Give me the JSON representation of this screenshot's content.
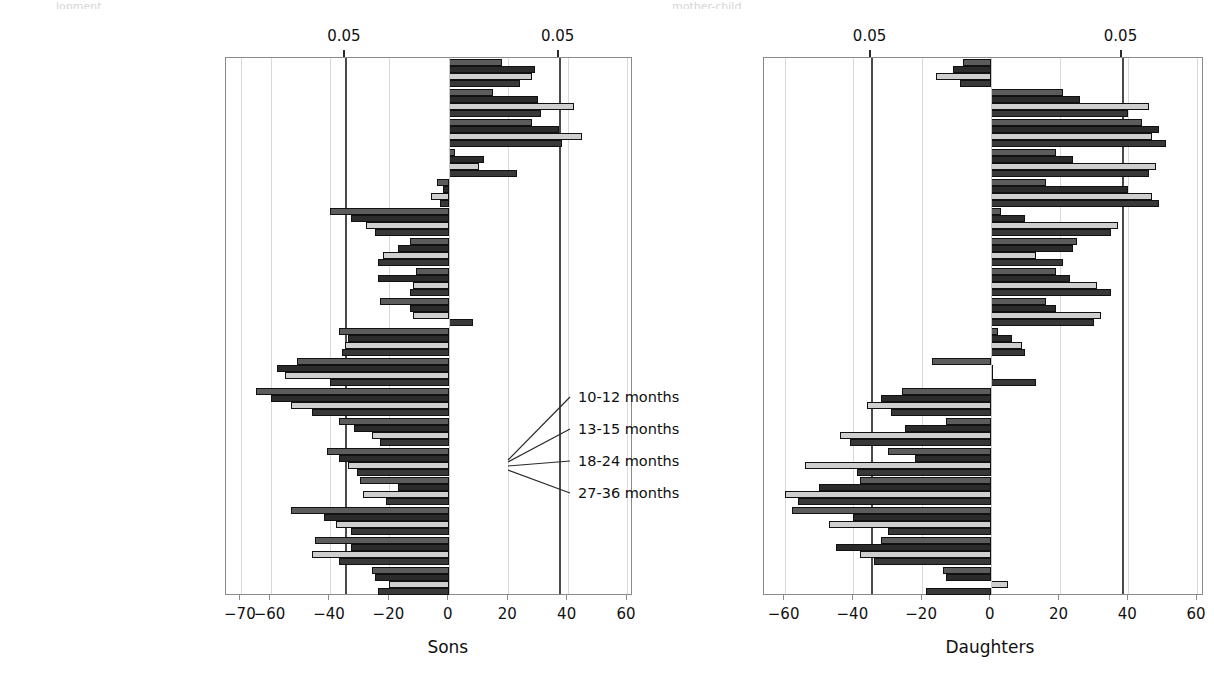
{
  "figure": {
    "top_fragments": [
      "lopment",
      "mother-child"
    ],
    "legend": {
      "items": [
        "10-12 months",
        "13-15 months",
        "18-24 months",
        "27-36 months"
      ],
      "series_keys": [
        "10-12",
        "13-15",
        "18-24",
        "27-36"
      ]
    }
  },
  "chart_data": {
    "type": "bar",
    "orientation": "horizontal",
    "title": "",
    "grid": true,
    "legend_position": "center-inside",
    "legend": [
      "10-12 months",
      "13-15 months",
      "18-24 months",
      "27-36 months"
    ],
    "series_colors": [
      "#5c5c5c",
      "#2b2b2b",
      "#cfcfcf",
      "#383838"
    ],
    "categories": [
      "Autonomy",
      "Positive evaluation",
      "Equalitarianism",
      "Expression of affection",
      "Emotional involvement",
      "Fostering dependency",
      "Excessive contact",
      "Achievement demand",
      "Concern about health",
      "Intrusiveness",
      "Anxiety",
      "Irritability",
      "Punishment",
      "Use of fear to control",
      "Strictness",
      "Perceives child as burden",
      "Punitiveness",
      "Ignoring"
    ],
    "panels": [
      {
        "name": "Sons",
        "xlabel": "Sons",
        "xlim": [
          -75,
          62
        ],
        "xticks": [
          -70,
          -60,
          -40,
          -20,
          0,
          20,
          40,
          60
        ],
        "xticklabels": [
          "−70",
          "−60",
          "−40",
          "−20",
          "0",
          "20",
          "40",
          "60"
        ],
        "significance_lines": [
          -35,
          37
        ],
        "significance_labels": [
          "0.05",
          "0.05"
        ],
        "series": [
          {
            "name": "10-12 months",
            "values": [
              18,
              15,
              28,
              2,
              -4,
              -40,
              -13,
              -11,
              -23,
              -37,
              -51,
              -65,
              -37,
              -41,
              -30,
              -53,
              -45,
              -26
            ]
          },
          {
            "name": "13-15 months",
            "values": [
              29,
              30,
              37,
              12,
              -2,
              -33,
              -17,
              -24,
              -13,
              -34,
              -58,
              -60,
              -32,
              -37,
              -17,
              -42,
              -33,
              -25
            ]
          },
          {
            "name": "18-24 months",
            "values": [
              28,
              42,
              45,
              10,
              -6,
              -28,
              -22,
              -12,
              -12,
              -35,
              -55,
              -53,
              -26,
              -34,
              -29,
              -38,
              -46,
              -20
            ]
          },
          {
            "name": "27-36 months",
            "values": [
              24,
              31,
              38,
              23,
              -3,
              -25,
              -24,
              -13,
              8,
              -36,
              -40,
              -46,
              -23,
              -31,
              -21,
              -33,
              -37,
              -24
            ]
          }
        ]
      },
      {
        "name": "Daughters",
        "xlabel": "Daughters",
        "xlim": [
          -66,
          62
        ],
        "xticks": [
          -60,
          -40,
          -20,
          0,
          20,
          40,
          60
        ],
        "xticklabels": [
          "−60",
          "−40",
          "−20",
          "0",
          "20",
          "40",
          "60"
        ],
        "significance_lines": [
          -35,
          38
        ],
        "significance_labels": [
          "0.05",
          "0.05"
        ],
        "series": [
          {
            "name": "10-12 months",
            "values": [
              -8,
              21,
              44,
              19,
              16,
              3,
              25,
              19,
              16,
              2,
              -17,
              -26,
              -13,
              -30,
              -38,
              -58,
              -32,
              -14
            ]
          },
          {
            "name": "13-15 months",
            "values": [
              -11,
              26,
              49,
              24,
              40,
              10,
              24,
              23,
              19,
              6,
              0,
              -32,
              -25,
              -22,
              -50,
              -40,
              -45,
              -13
            ]
          },
          {
            "name": "18-24 months",
            "values": [
              -16,
              46,
              47,
              48,
              47,
              37,
              13,
              31,
              32,
              9,
              0,
              -36,
              -44,
              -54,
              -60,
              -47,
              -38,
              5
            ]
          },
          {
            "name": "27-36 months",
            "values": [
              -9,
              40,
              51,
              46,
              49,
              35,
              21,
              35,
              30,
              10,
              13,
              -29,
              -41,
              -39,
              -56,
              -30,
              -34,
              -19
            ]
          }
        ]
      }
    ]
  }
}
